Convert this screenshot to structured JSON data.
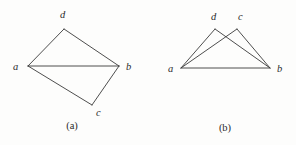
{
  "figure": {
    "background_color": "#fdfdfc",
    "line_color": "#3a3a3a",
    "label_color": "#2b2b2b",
    "width": 296,
    "height": 145
  },
  "diagram_a": {
    "caption": "(a)",
    "caption_x": 72,
    "caption_y": 129,
    "vertices": [
      {
        "id": "a",
        "label": "a",
        "x": 28,
        "y": 66,
        "label_x": 13,
        "label_y": 70
      },
      {
        "id": "d",
        "label": "d",
        "x": 64,
        "y": 29,
        "label_x": 60,
        "label_y": 18
      },
      {
        "id": "b",
        "label": "b",
        "x": 119,
        "y": 66,
        "label_x": 126,
        "label_y": 70
      },
      {
        "id": "c",
        "label": "c",
        "x": 92,
        "y": 105,
        "label_x": 96,
        "label_y": 116
      }
    ],
    "edges": [
      {
        "id": "a-d",
        "from": "a",
        "to": "d",
        "x1": 28,
        "y1": 66,
        "x2": 64,
        "y2": 29
      },
      {
        "id": "d-b",
        "from": "d",
        "to": "b",
        "x1": 64,
        "y1": 29,
        "x2": 119,
        "y2": 66
      },
      {
        "id": "a-b",
        "from": "a",
        "to": "b",
        "x1": 28,
        "y1": 66,
        "x2": 119,
        "y2": 66
      },
      {
        "id": "a-c",
        "from": "a",
        "to": "c",
        "x1": 28,
        "y1": 66,
        "x2": 92,
        "y2": 105
      },
      {
        "id": "c-b",
        "from": "c",
        "to": "b",
        "x1": 92,
        "y1": 105,
        "x2": 119,
        "y2": 66
      }
    ]
  },
  "diagram_b": {
    "caption": "(b)",
    "caption_x": 225,
    "caption_y": 131,
    "vertices": [
      {
        "id": "a",
        "label": "a",
        "x": 181,
        "y": 68,
        "label_x": 168,
        "label_y": 72
      },
      {
        "id": "d",
        "label": "d",
        "x": 215,
        "y": 29,
        "label_x": 211,
        "label_y": 20
      },
      {
        "id": "c",
        "label": "c",
        "x": 237,
        "y": 29,
        "label_x": 238,
        "label_y": 20
      },
      {
        "id": "b",
        "label": "b",
        "x": 270,
        "y": 68,
        "label_x": 277,
        "label_y": 72
      }
    ],
    "edges": [
      {
        "id": "a-d",
        "from": "a",
        "to": "d",
        "x1": 181,
        "y1": 68,
        "x2": 215,
        "y2": 29
      },
      {
        "id": "d-b",
        "from": "d",
        "to": "b",
        "x1": 215,
        "y1": 29,
        "x2": 270,
        "y2": 68
      },
      {
        "id": "a-c",
        "from": "a",
        "to": "c",
        "x1": 181,
        "y1": 68,
        "x2": 237,
        "y2": 29
      },
      {
        "id": "c-b",
        "from": "c",
        "to": "b",
        "x1": 237,
        "y1": 29,
        "x2": 270,
        "y2": 68
      },
      {
        "id": "a-b",
        "from": "a",
        "to": "b",
        "x1": 181,
        "y1": 68,
        "x2": 270,
        "y2": 68
      }
    ]
  }
}
